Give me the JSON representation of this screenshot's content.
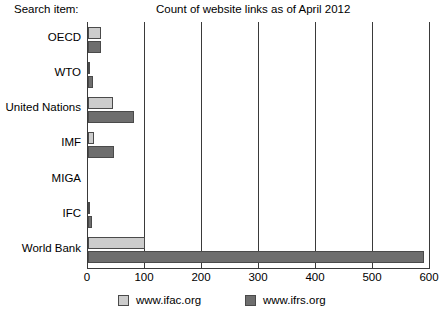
{
  "header": {
    "axis_caption": "Search item:",
    "title": "Count of website links as of April 2012"
  },
  "legend": {
    "items": [
      {
        "label": "www.ifac.org",
        "color": "#cccccc"
      },
      {
        "label": "www.ifrs.org",
        "color": "#6e6e6e"
      }
    ]
  },
  "bottom_caption": "",
  "chart_data": {
    "type": "bar",
    "orientation": "horizontal",
    "title": "Count of website links as of April 2012",
    "xlabel": "",
    "ylabel": "Search item:",
    "xlim": [
      0,
      600
    ],
    "xticks": [
      0,
      100,
      200,
      300,
      400,
      500,
      600
    ],
    "xtick_labels": [
      "0",
      "100",
      "200",
      "300",
      "400",
      "500",
      "600"
    ],
    "grid": true,
    "grid_axis": "x",
    "legend_position": "bottom",
    "categories": [
      "OECD",
      "WTO",
      "United Nations",
      "IMF",
      "MIGA",
      "IFC",
      "World Bank"
    ],
    "series": [
      {
        "name": "www.ifac.org",
        "color": "#cccccc",
        "values": [
          22,
          1,
          44,
          10,
          0,
          1,
          100
        ]
      },
      {
        "name": "www.ifrs.org",
        "color": "#6e6e6e",
        "values": [
          23,
          8,
          80,
          45,
          0,
          7,
          590
        ]
      }
    ]
  }
}
